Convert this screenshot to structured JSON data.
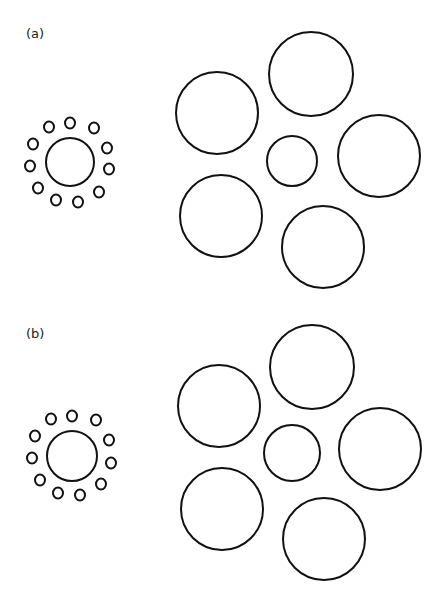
{
  "figure": {
    "panels": [
      {
        "label": "(a)",
        "label_pos": [
          26,
          36
        ],
        "left_group": {
          "center": {
            "cx": 70,
            "cy": 162,
            "r": 24
          },
          "inducers": [
            {
              "cx": 49,
              "cy": 127,
              "rx": 5,
              "ry": 5.5
            },
            {
              "cx": 70,
              "cy": 123,
              "rx": 5,
              "ry": 5.5
            },
            {
              "cx": 94,
              "cy": 128,
              "rx": 5,
              "ry": 5.5
            },
            {
              "cx": 33,
              "cy": 144,
              "rx": 5,
              "ry": 5.5
            },
            {
              "cx": 107,
              "cy": 148,
              "rx": 5,
              "ry": 5.5
            },
            {
              "cx": 30,
              "cy": 166,
              "rx": 5,
              "ry": 5.5
            },
            {
              "cx": 109,
              "cy": 169,
              "rx": 5,
              "ry": 5.5
            },
            {
              "cx": 38,
              "cy": 188,
              "rx": 5,
              "ry": 5.5
            },
            {
              "cx": 99,
              "cy": 192,
              "rx": 5,
              "ry": 5.5
            },
            {
              "cx": 56,
              "cy": 200,
              "rx": 5,
              "ry": 5.5
            },
            {
              "cx": 78,
              "cy": 202,
              "rx": 5,
              "ry": 5.5
            }
          ]
        },
        "right_group": {
          "center": {
            "cx": 292,
            "cy": 161,
            "r": 25
          },
          "inducers": [
            {
              "cx": 311,
              "cy": 74,
              "r": 42
            },
            {
              "cx": 217,
              "cy": 113,
              "r": 41
            },
            {
              "cx": 379,
              "cy": 156,
              "r": 41
            },
            {
              "cx": 221,
              "cy": 216,
              "r": 41
            },
            {
              "cx": 323,
              "cy": 247,
              "r": 41
            }
          ]
        }
      },
      {
        "label": "(b)",
        "label_pos": [
          26,
          336
        ],
        "left_group": {
          "center": {
            "cx": 72,
            "cy": 456,
            "r": 25
          },
          "inducers": [
            {
              "cx": 51,
              "cy": 419,
              "rx": 5,
              "ry": 5.5
            },
            {
              "cx": 72,
              "cy": 416,
              "rx": 5,
              "ry": 5.5
            },
            {
              "cx": 96,
              "cy": 420,
              "rx": 5,
              "ry": 5.5
            },
            {
              "cx": 35,
              "cy": 436,
              "rx": 5,
              "ry": 5.5
            },
            {
              "cx": 109,
              "cy": 440,
              "rx": 5,
              "ry": 5.5
            },
            {
              "cx": 32,
              "cy": 458,
              "rx": 5,
              "ry": 5.5
            },
            {
              "cx": 111,
              "cy": 463,
              "rx": 5,
              "ry": 5.5
            },
            {
              "cx": 40,
              "cy": 480,
              "rx": 5,
              "ry": 5.5
            },
            {
              "cx": 101,
              "cy": 484,
              "rx": 5,
              "ry": 5.5
            },
            {
              "cx": 58,
              "cy": 493,
              "rx": 5,
              "ry": 5.5
            },
            {
              "cx": 80,
              "cy": 495,
              "rx": 5,
              "ry": 5.5
            }
          ]
        },
        "right_group": {
          "center": {
            "cx": 292,
            "cy": 453,
            "r": 28
          },
          "inducers": [
            {
              "cx": 312,
              "cy": 367,
              "r": 42
            },
            {
              "cx": 219,
              "cy": 406,
              "r": 41
            },
            {
              "cx": 380,
              "cy": 449,
              "r": 41
            },
            {
              "cx": 222,
              "cy": 509,
              "r": 41
            },
            {
              "cx": 324,
              "cy": 539,
              "r": 41
            }
          ]
        }
      }
    ],
    "stroke_color": "#111111",
    "background": "#ffffff"
  }
}
